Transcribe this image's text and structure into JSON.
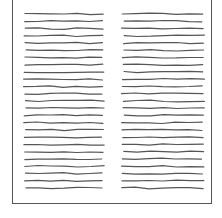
{
  "document": {
    "type": "sketched-page",
    "columns": [
      {
        "name": "left",
        "x_start": 25,
        "x_end": 103
      },
      {
        "name": "right",
        "x_start": 123,
        "x_end": 203
      }
    ],
    "line_count_per_column": 25,
    "first_line_y": 14,
    "line_spacing": 7.25,
    "line_color": "#555555",
    "border_color": "#555555"
  }
}
